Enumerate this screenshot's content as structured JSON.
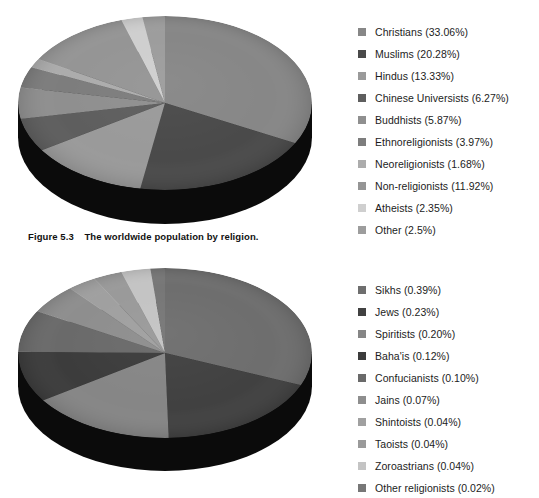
{
  "figure": {
    "caption_label": "Figure 5.3",
    "caption_text": "The worldwide population by religion.",
    "background": "#ffffff"
  },
  "chart_data": [
    {
      "type": "pie",
      "id": "pie-major-religions",
      "title": "The worldwide population by religion",
      "legend_position": "right",
      "three_d": true,
      "depth_color": "#0b0b0b",
      "units": "%",
      "categories": [
        "Christians",
        "Muslims",
        "Hindus",
        "Chinese Universists",
        "Buddhists",
        "Ethnoreligionists",
        "Neoreligionists",
        "Non-religionists",
        "Atheists",
        "Other"
      ],
      "values": [
        33.06,
        20.28,
        13.33,
        6.27,
        5.87,
        3.97,
        1.68,
        11.92,
        2.35,
        2.5
      ],
      "labels": [
        "Christians (33.06%)",
        "Muslims (20.28%)",
        "Hindus (13.33%)",
        "Chinese Universists (6.27%)",
        "Buddhists (5.87%)",
        "Ethnoreligionists (3.97%)",
        "Neoreligionists (1.68%)",
        "Non-religionists (11.92%)",
        "Atheists (2.35%)",
        "Other (2.5%)"
      ],
      "colors": [
        "#878787",
        "#4a4a4a",
        "#9a9a9a",
        "#5e5e5e",
        "#8f8f8f",
        "#7d7d7d",
        "#acacac",
        "#959595",
        "#cfcfcf",
        "#9d9d9d"
      ]
    },
    {
      "type": "pie",
      "id": "pie-minor-religions",
      "title": "Smaller religious groups",
      "legend_position": "right",
      "three_d": true,
      "depth_color": "#0b0b0b",
      "units": "%",
      "categories": [
        "Sikhs",
        "Jews",
        "Spiritists",
        "Baha'is",
        "Confucianists",
        "Jains",
        "Shintoists",
        "Taoists",
        "Zoroastrians",
        "Other religionists"
      ],
      "values": [
        0.39,
        0.23,
        0.2,
        0.12,
        0.1,
        0.07,
        0.04,
        0.04,
        0.04,
        0.02
      ],
      "labels": [
        "Sikhs (0.39%)",
        "Jews (0.23%)",
        "Spiritists (0.20%)",
        "Baha'is (0.12%)",
        "Confucianists (0.10%)",
        "Jains (0.07%)",
        "Shintoists (0.04%)",
        "Taoists (0.04%)",
        "Zoroastrians (0.04%)",
        "Other religionists (0.02%)"
      ],
      "colors": [
        "#6e6e6e",
        "#414141",
        "#868686",
        "#3c3c3c",
        "#6a6a6a",
        "#8e8e8e",
        "#a0a0a0",
        "#9a9a9a",
        "#c4c4c4",
        "#777777"
      ]
    }
  ],
  "legends": [
    {
      "id": "legend-major-religions",
      "items": [
        {
          "label": "Christians (33.06%)",
          "color": "#878787"
        },
        {
          "label": "Muslims (20.28%)",
          "color": "#4a4a4a"
        },
        {
          "label": "Hindus (13.33%)",
          "color": "#9a9a9a"
        },
        {
          "label": "Chinese Universists (6.27%)",
          "color": "#5e5e5e"
        },
        {
          "label": "Buddhists (5.87%)",
          "color": "#8f8f8f"
        },
        {
          "label": "Ethnoreligionists (3.97%)",
          "color": "#7d7d7d"
        },
        {
          "label": "Neoreligionists (1.68%)",
          "color": "#acacac"
        },
        {
          "label": "Non-religionists (11.92%)",
          "color": "#959595"
        },
        {
          "label": "Atheists (2.35%)",
          "color": "#cfcfcf"
        },
        {
          "label": "Other (2.5%)",
          "color": "#9d9d9d"
        }
      ]
    },
    {
      "id": "legend-minor-religions",
      "items": [
        {
          "label": "Sikhs (0.39%)",
          "color": "#6e6e6e"
        },
        {
          "label": "Jews (0.23%)",
          "color": "#414141"
        },
        {
          "label": "Spiritists (0.20%)",
          "color": "#868686"
        },
        {
          "label": "Baha'is (0.12%)",
          "color": "#3c3c3c"
        },
        {
          "label": "Confucianists (0.10%)",
          "color": "#6a6a6a"
        },
        {
          "label": "Jains (0.07%)",
          "color": "#8e8e8e"
        },
        {
          "label": "Shintoists (0.04%)",
          "color": "#a0a0a0"
        },
        {
          "label": "Taoists (0.04%)",
          "color": "#9a9a9a"
        },
        {
          "label": "Zoroastrians (0.04%)",
          "color": "#c4c4c4"
        },
        {
          "label": "Other religionists (0.02%)",
          "color": "#777777"
        }
      ]
    }
  ]
}
